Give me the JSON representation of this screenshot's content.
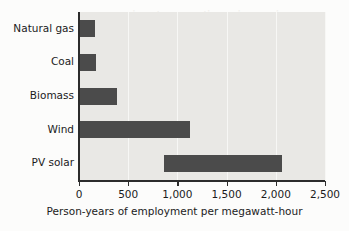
{
  "chart_data": {
    "type": "bar",
    "orientation": "horizontal",
    "title": "",
    "xlabel": "Person-years of employment per megawatt-hour",
    "ylabel": "",
    "categories": [
      "Natural gas",
      "Coal",
      "Biomass",
      "Wind",
      "PV solar"
    ],
    "values": [
      160,
      170,
      390,
      1130,
      2060
    ],
    "bar_ranges": [
      {
        "category": "Natural gas",
        "start": 0,
        "end": 160
      },
      {
        "category": "Coal",
        "start": 0,
        "end": 170
      },
      {
        "category": "Biomass",
        "start": 0,
        "end": 390
      },
      {
        "category": "Wind",
        "start": 0,
        "end": 1130
      },
      {
        "category": "PV solar",
        "start": 865,
        "end": 2060
      }
    ],
    "xlim": [
      0,
      2500
    ],
    "xticks": [
      0,
      500,
      1000,
      1500,
      2000,
      2500
    ],
    "xticklabels": [
      "0",
      "500",
      "1,000",
      "1,500",
      "2,000",
      "2,500"
    ],
    "grid": true,
    "grid_axis": "x",
    "legend": null,
    "colors": {
      "bar": "#4b4b4b",
      "plot_background": "#e9e8e5",
      "page_background": "#fcfcfb",
      "axis": "#2c2c2c",
      "gridline": "#f7f7f5",
      "text": "#1b1b1b"
    }
  },
  "bleed_through": {
    "line1": "jog pni nenitnoo nuta ni",
    "line2": "lsoi gniaoo"
  }
}
